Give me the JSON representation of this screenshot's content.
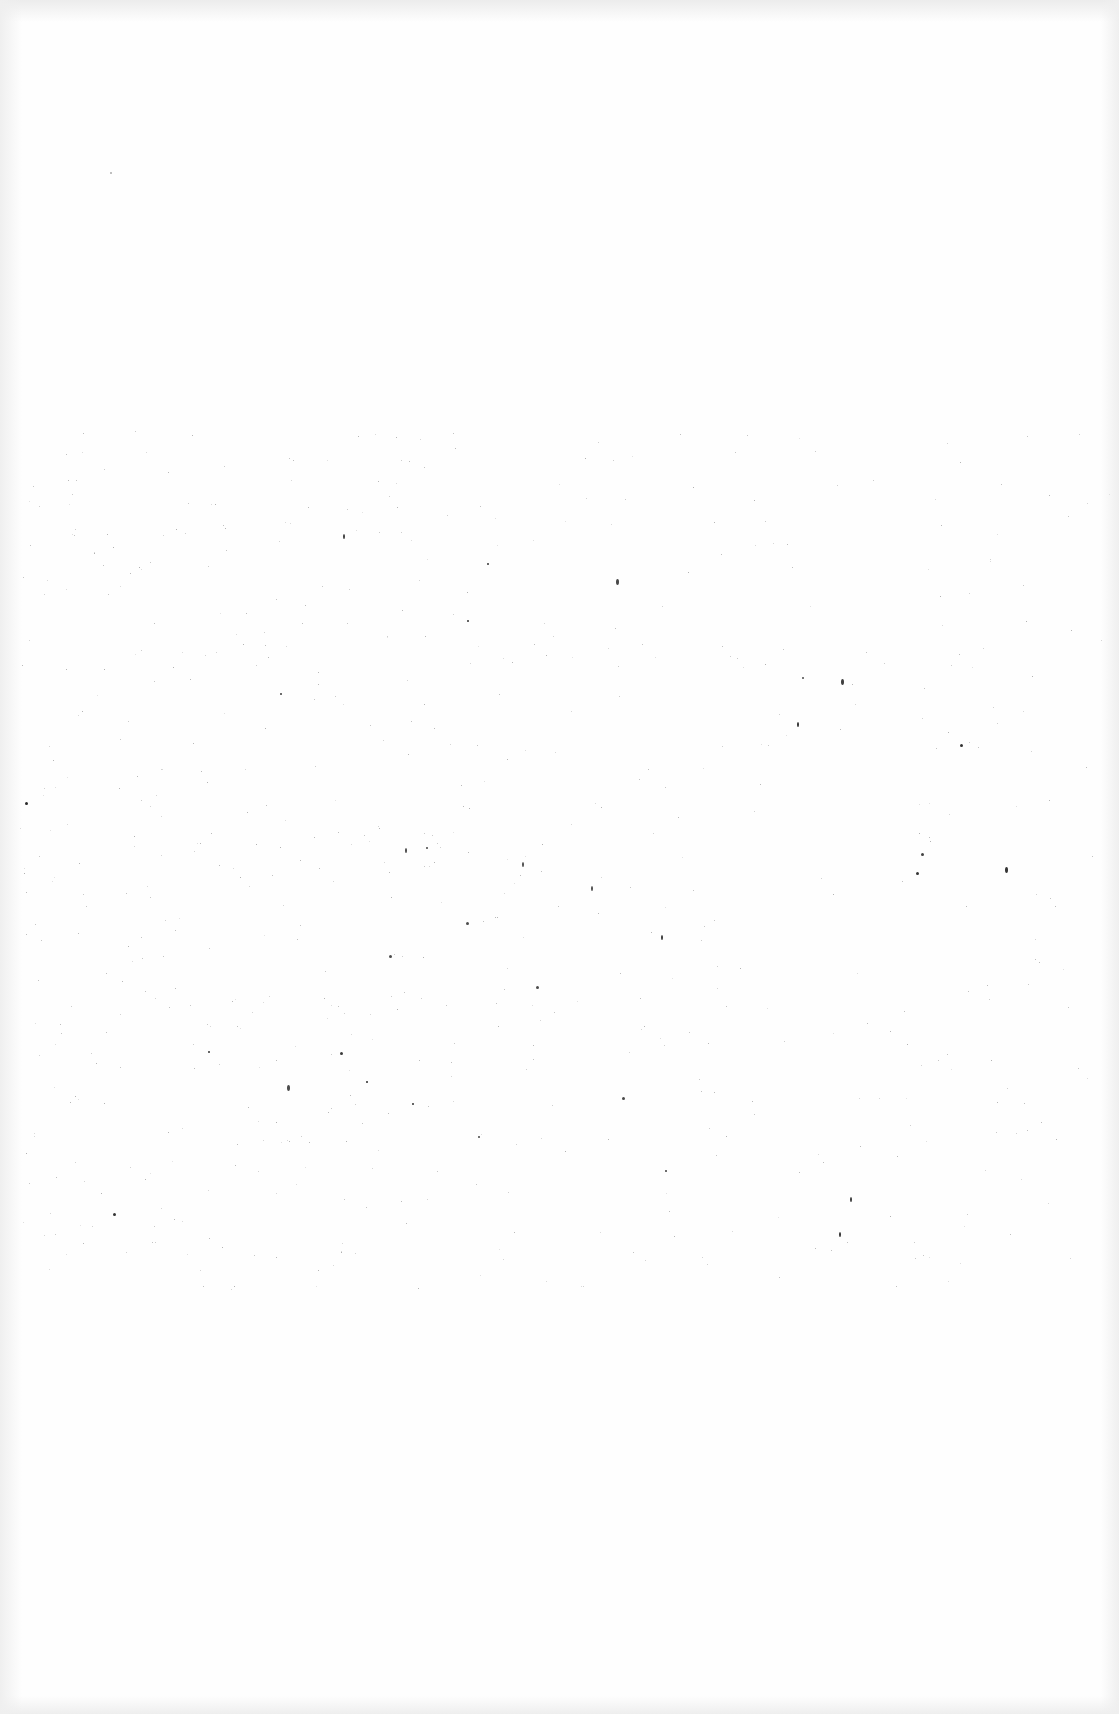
{
  "page": {
    "type": "blank scanned page",
    "background_color": "#fefefe",
    "edge_shade_color": "#ececec",
    "speckle_color": "#555555",
    "text": ""
  }
}
